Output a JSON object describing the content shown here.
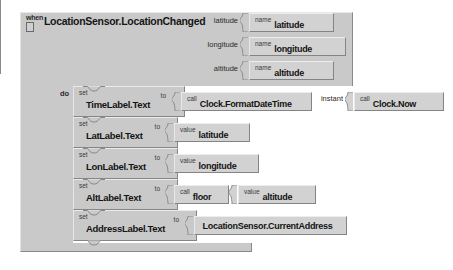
{
  "app": {
    "name": "MIT App Inventor Blocks Editor",
    "background_color": "#ffffff",
    "block_color": "#c9c9c9",
    "value_block_color": "#d2d2d2",
    "border_color": "#848484"
  },
  "event_block": {
    "keyword_when": "when",
    "title": "LocationSensor.LocationChanged",
    "keyword_do": "do",
    "mutator_icon": "mutator-box-icon",
    "parameters": [
      {
        "socket_label": "latitude",
        "keyword": "name",
        "value": "latitude"
      },
      {
        "socket_label": "longitude",
        "keyword": "name",
        "value": "longitude"
      },
      {
        "socket_label": "altitude",
        "keyword": "name",
        "value": "altitude"
      }
    ]
  },
  "statements": [
    {
      "keyword_set": "set",
      "property": "TimeLabel.Text",
      "keyword_to": "to",
      "value_blocks": [
        {
          "keyword": "call",
          "value": "Clock.FormatDateTime"
        },
        {
          "socket_label": "instant",
          "keyword": "call",
          "value": "Clock.Now"
        }
      ]
    },
    {
      "keyword_set": "set",
      "property": "LatLabel.Text",
      "keyword_to": "to",
      "value_blocks": [
        {
          "keyword": "value",
          "value": "latitude"
        }
      ]
    },
    {
      "keyword_set": "set",
      "property": "LonLabel.Text",
      "keyword_to": "to",
      "value_blocks": [
        {
          "keyword": "value",
          "value": "longitude"
        }
      ]
    },
    {
      "keyword_set": "set",
      "property": "AltLabel.Text",
      "keyword_to": "to",
      "value_blocks": [
        {
          "keyword": "call",
          "value": "floor"
        },
        {
          "keyword": "value",
          "value": "altitude"
        }
      ]
    },
    {
      "keyword_set": "set",
      "property": "AddressLabel.Text",
      "keyword_to": "to",
      "value_blocks": [
        {
          "keyword": "",
          "value": "LocationSensor.CurrentAddress"
        }
      ]
    }
  ]
}
